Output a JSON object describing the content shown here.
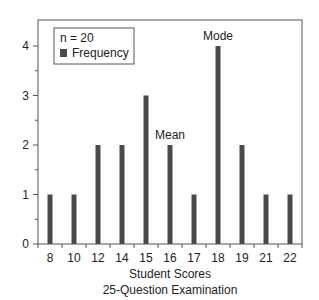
{
  "chart_data": {
    "type": "bar",
    "title": "",
    "xlabel": "Student Scores",
    "xlabel2": "25-Question Examination",
    "ylabel": "",
    "categories": [
      "8",
      "10",
      "12",
      "14",
      "15",
      "16",
      "17",
      "18",
      "19",
      "21",
      "22"
    ],
    "values": [
      1,
      1,
      2,
      2,
      3,
      2,
      1,
      4,
      2,
      1,
      1
    ],
    "ylim": [
      0,
      4.5
    ],
    "yticks": [
      "0",
      "1",
      "2",
      "3",
      "4"
    ],
    "grid": false,
    "legend": {
      "position": "upper-left",
      "title": "n = 20",
      "entries": [
        "Frequency"
      ]
    },
    "annotations": [
      {
        "text": "Mode",
        "category": "18"
      },
      {
        "text": "Mean",
        "category": "16"
      }
    ],
    "bar_color": "#4a4a4a"
  }
}
